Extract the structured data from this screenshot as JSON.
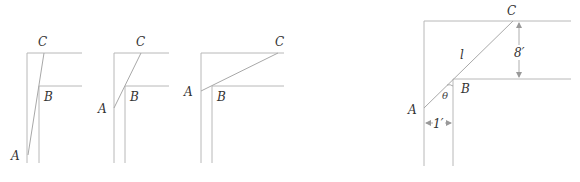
{
  "figure": {
    "panels": [
      {
        "id": "panel-1",
        "labels": {
          "A": "A",
          "B": "B",
          "C": "C"
        }
      },
      {
        "id": "panel-2",
        "labels": {
          "A": "A",
          "B": "B",
          "C": "C"
        }
      },
      {
        "id": "panel-3",
        "labels": {
          "A": "A",
          "B": "B",
          "C": "C"
        }
      },
      {
        "id": "panel-4",
        "labels": {
          "A": "A",
          "B": "B",
          "C": "C",
          "length": "l",
          "angle": "θ"
        },
        "dimensions": {
          "vertical_width": "8′",
          "horizontal_width": "1′"
        }
      }
    ]
  }
}
